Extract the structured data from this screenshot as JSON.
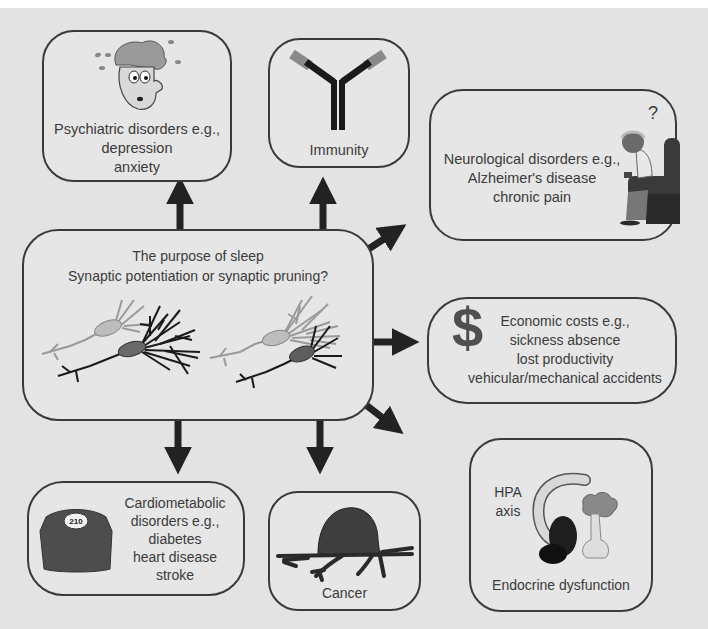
{
  "diagram": {
    "center": {
      "title": "The purpose of sleep",
      "subtitle": "Synaptic potentiation or synaptic pruning?",
      "illustration": "neuron-pairs-icon"
    },
    "boxes": {
      "psychiatric": {
        "lines": [
          "Psychiatric disorders e.g.,",
          "depression",
          "anxiety"
        ],
        "icon": "anxious-face-icon"
      },
      "immunity": {
        "lines": [
          "Immunity"
        ],
        "icon": "antibody-icon"
      },
      "neurological": {
        "lines": [
          "Neurological disorders e.g.,",
          "Alzheimer's disease",
          "chronic pain"
        ],
        "icon": "elderly-man-armchair-icon",
        "icon_label": "?"
      },
      "economic": {
        "lines": [
          "Economic costs e.g.,",
          "sickness absence",
          "lost productivity",
          "vehicular/mechanical accidents"
        ],
        "icon": "dollar-icon",
        "icon_label": "$"
      },
      "endocrine": {
        "lines": [
          "Endocrine dysfunction"
        ],
        "sub_lines": [
          "HPA",
          "axis"
        ],
        "icon": "hpa-axis-icon"
      },
      "cancer": {
        "lines": [
          "Cancer"
        ],
        "icon": "tumor-icon"
      },
      "cardiometabolic": {
        "lines": [
          "Cardiometabolic",
          "disorders e.g.,",
          "diabetes",
          "heart disease",
          "stroke"
        ],
        "icon": "weighing-scale-icon",
        "icon_label": "210"
      }
    },
    "arrows": [
      {
        "from": "center",
        "to": "psychiatric",
        "direction": "up"
      },
      {
        "from": "center",
        "to": "immunity",
        "direction": "up"
      },
      {
        "from": "center",
        "to": "neurological",
        "direction": "up-right"
      },
      {
        "from": "center",
        "to": "economic",
        "direction": "right"
      },
      {
        "from": "center",
        "to": "endocrine",
        "direction": "down-right"
      },
      {
        "from": "center",
        "to": "cardiometabolic",
        "direction": "down"
      },
      {
        "from": "center",
        "to": "cancer",
        "direction": "down"
      }
    ],
    "colors": {
      "background": "#e3e3e3",
      "border": "#3a3a3a",
      "arrow": "#222222",
      "text": "#3b3b3b"
    }
  }
}
